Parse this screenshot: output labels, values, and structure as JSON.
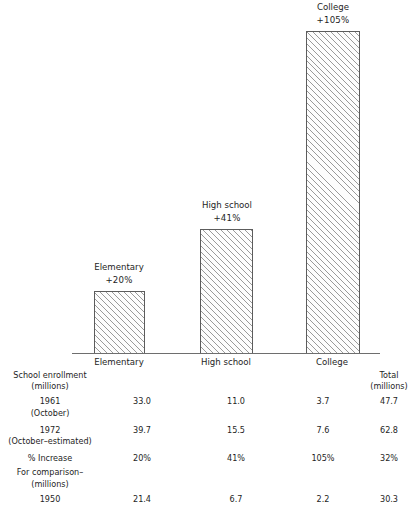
{
  "chart_data": {
    "type": "bar",
    "title": "",
    "subtitle": "",
    "xlabel": "",
    "ylabel": "",
    "grid": false,
    "legend": "none",
    "ylim": [
      0,
      115
    ],
    "categories": [
      "Elementary",
      "High school",
      "College"
    ],
    "values": [
      20,
      41,
      105
    ],
    "value_labels": [
      "+20%",
      "+41%",
      "+105%"
    ],
    "series": [
      {
        "name": "% Increase 1961 to 1972",
        "values": [
          20,
          41,
          105
        ]
      }
    ],
    "annotations": [
      {
        "category": "Elementary",
        "name": "Elementary",
        "value": "+20%"
      },
      {
        "category": "High school",
        "name": "High school",
        "value": "+41%"
      },
      {
        "category": "College",
        "name": "College",
        "value": "+105%"
      }
    ],
    "tick_labels": [
      "Elementary",
      "High school",
      "College"
    ]
  },
  "bars": [
    {
      "name": "Elementary",
      "value_label": "+20%"
    },
    {
      "name": "High school",
      "value_label": "+41%"
    },
    {
      "name": "College",
      "value_label": "+105%"
    }
  ],
  "axis": {
    "ticks": [
      "Elementary",
      "High school",
      "College"
    ]
  },
  "table": {
    "column_headers": [
      "Elementary",
      "High school",
      "College"
    ],
    "total_header_line1": "Total",
    "total_header_line2": "(millions)",
    "section1_line1": "School enrollment",
    "section1_line2": "(millions)",
    "section2_line1": "For comparison–",
    "section2_line2": "(millions)",
    "rows": [
      {
        "label_line1": "1961",
        "label_line2": "(October)",
        "elementary": "33.0",
        "highschool": "11.0",
        "college": "3.7",
        "total": "47.7"
      },
      {
        "label_line1": "1972",
        "label_line2": "(October–estimated)",
        "elementary": "39.7",
        "highschool": "15.5",
        "college": "7.6",
        "total": "62.8"
      },
      {
        "label_line1": "% Increase",
        "label_line2": "",
        "elementary": "20%",
        "highschool": "41%",
        "college": "105%",
        "total": "32%"
      },
      {
        "label_line1": "1950",
        "label_line2": "",
        "elementary": "21.4",
        "highschool": "6.7",
        "college": "2.2",
        "total": "30.3"
      }
    ]
  },
  "colors": {
    "bar_edge": "#5c5c5c",
    "bar_hatch": "#9a9a9a",
    "axis_line": "#6e6e6e",
    "text": "#1e1e1e",
    "background": "#ffffff"
  }
}
